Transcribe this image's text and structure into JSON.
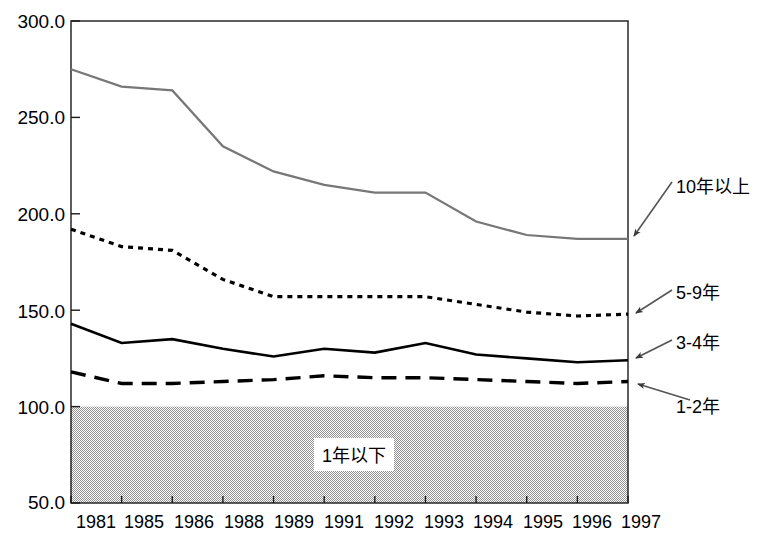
{
  "chart_data": {
    "type": "line",
    "title": "",
    "xlabel": "",
    "ylabel": "",
    "categories": [
      "1981",
      "1985",
      "1986",
      "1988",
      "1989",
      "1991",
      "1992",
      "1993",
      "1994",
      "1995",
      "1996",
      "1997"
    ],
    "ylim": [
      50.0,
      300.0
    ],
    "yticks": [
      "300.0",
      "250.0",
      "200.0",
      "150.0",
      "100.0",
      "50.0"
    ],
    "ytick_values": [
      300.0,
      250.0,
      200.0,
      150.0,
      100.0,
      50.0
    ],
    "grid": false,
    "legend_position": "right-annotations",
    "series": [
      {
        "name": "10年以上",
        "style": "thin-gray-solid",
        "values": [
          275.0,
          266.0,
          264.0,
          235.0,
          222.0,
          215.0,
          211.0,
          211.0,
          196.0,
          189.0,
          187.0,
          187.0
        ]
      },
      {
        "name": "5-9年",
        "style": "dotted",
        "values": [
          192.0,
          183.0,
          181.0,
          166.0,
          157.0,
          157.0,
          157.0,
          157.0,
          153.0,
          149.0,
          147.0,
          148.0
        ]
      },
      {
        "name": "3-4年",
        "style": "thick-solid",
        "values": [
          143.0,
          133.0,
          135.0,
          130.0,
          126.0,
          130.0,
          128.0,
          133.0,
          127.0,
          125.0,
          123.0,
          124.0
        ]
      },
      {
        "name": "1-2年",
        "style": "dashed",
        "values": [
          118.0,
          112.0,
          112.0,
          113.0,
          114.0,
          116.0,
          115.0,
          115.0,
          114.0,
          113.0,
          112.0,
          113.0
        ]
      }
    ],
    "shaded_band": {
      "label": "1年以下",
      "from": 50.0,
      "to": 100.0,
      "fill": "#a8a8a8"
    },
    "annotations": [
      {
        "text": "10年以上",
        "series": "10年以上"
      },
      {
        "text": "5-9年",
        "series": "5-9年"
      },
      {
        "text": "3-4年",
        "series": "3-4年"
      },
      {
        "text": "1-2年",
        "series": "1-2年"
      }
    ]
  },
  "labels": {
    "y0": "300.0",
    "y1": "250.0",
    "y2": "200.0",
    "y3": "150.0",
    "y4": "100.0",
    "y5": "50.0",
    "x0": "1981",
    "x1": "1985",
    "x2": "1986",
    "x3": "1988",
    "x4": "1989",
    "x5": "1991",
    "x6": "1992",
    "x7": "1993",
    "x8": "1994",
    "x9": "1995",
    "x10": "1996",
    "x11": "1997",
    "ann_10plus": "10年以上",
    "ann_5_9": "5-9年",
    "ann_3_4": "3-4年",
    "ann_1_2": "1-2年",
    "band_label": "1年以下"
  },
  "colors": {
    "axis": "#000000",
    "series_10plus": "#777777",
    "series_5_9": "#000000",
    "series_3_4": "#000000",
    "series_1_2": "#000000",
    "band_fill": "#a8a8a8",
    "background": "#ffffff"
  }
}
